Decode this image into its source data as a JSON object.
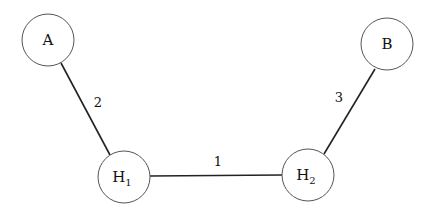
{
  "diagram": {
    "type": "network-graph",
    "nodes": [
      {
        "id": "A",
        "label": "A",
        "sub": "",
        "cx": 48,
        "cy": 40,
        "r": 26
      },
      {
        "id": "B",
        "label": "B",
        "sub": "",
        "cx": 387,
        "cy": 44,
        "r": 26
      },
      {
        "id": "H1",
        "label": "H",
        "sub": "1",
        "cx": 124,
        "cy": 177,
        "r": 26
      },
      {
        "id": "H2",
        "label": "H",
        "sub": "2",
        "cx": 308,
        "cy": 175,
        "r": 26
      }
    ],
    "edges": [
      {
        "from": "H1",
        "to": "H2",
        "label": "1",
        "x1": 150,
        "y1": 176,
        "x2": 282,
        "y2": 175,
        "lx": 218,
        "ly": 166
      },
      {
        "from": "A",
        "to": "H1",
        "label": "2",
        "x1": 61,
        "y1": 63,
        "x2": 110,
        "y2": 155,
        "lx": 98,
        "ly": 107
      },
      {
        "from": "B",
        "to": "H2",
        "label": "3",
        "x1": 375,
        "y1": 69,
        "x2": 324,
        "y2": 154,
        "lx": 339,
        "ly": 102
      }
    ]
  }
}
